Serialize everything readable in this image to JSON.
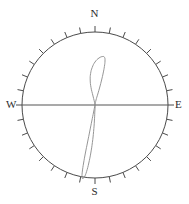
{
  "figure": {
    "title": "",
    "background_color": "#ffffff",
    "width": 189,
    "height": 204
  },
  "compass": {
    "north_label": "N",
    "south_label": "S",
    "west_label": "W",
    "east_label": "E",
    "center_x": 95,
    "center_y": 105,
    "radius": 73,
    "tick_count": 32,
    "tick_length": 6,
    "tick_step_degrees": 11.25,
    "axis_line": "west-east",
    "circle_color": "#4a4a4a",
    "tick_color": "#4a4a4a",
    "axis_color": "#555555",
    "curve_color": "#8a8a8a"
  },
  "chart_data": {
    "type": "line",
    "title": "",
    "subtitle": "",
    "xlabel": "",
    "ylabel": "",
    "projection": "polar-compass",
    "grid": false,
    "legend": null,
    "axis_ranges": {
      "theta_degrees": [
        0,
        360
      ],
      "r_normalized": [
        0,
        1
      ]
    },
    "tick_labels": [
      "N",
      "E",
      "S",
      "W"
    ],
    "tick_angles_degrees": [
      0,
      90,
      180,
      270
    ],
    "annotations": [],
    "series": [
      {
        "name": "orientation-trace",
        "closed": true,
        "description": "Narrow two-lobed (figure-eight) trace through the origin; short lobe points north-northeast, long lobe points south-southwest reaching the circle edge.",
        "points_xy": [
          [
            95,
            105
          ],
          [
            93.0,
            96.0
          ],
          [
            91.0,
            87.5
          ],
          [
            90.2,
            80.0
          ],
          [
            90.6,
            73.5
          ],
          [
            92.2,
            67.5
          ],
          [
            95.0,
            62.0
          ],
          [
            99.0,
            58.0
          ],
          [
            102.8,
            56.5
          ],
          [
            104.6,
            57.5
          ],
          [
            105.0,
            61.0
          ],
          [
            104.4,
            66.5
          ],
          [
            103.2,
            73.0
          ],
          [
            101.6,
            80.0
          ],
          [
            99.8,
            87.0
          ],
          [
            97.8,
            94.0
          ],
          [
            96.0,
            100.0
          ],
          [
            95.0,
            105.0
          ],
          [
            93.6,
            112.0
          ],
          [
            91.8,
            121.0
          ],
          [
            89.8,
            131.0
          ],
          [
            87.6,
            142.0
          ],
          [
            85.4,
            153.0
          ],
          [
            83.6,
            163.0
          ],
          [
            82.4,
            171.0
          ],
          [
            82.0,
            176.5
          ],
          [
            82.6,
            178.5
          ],
          [
            84.4,
            177.0
          ],
          [
            86.6,
            171.5
          ],
          [
            88.8,
            163.0
          ],
          [
            90.8,
            153.0
          ],
          [
            92.4,
            142.5
          ],
          [
            93.6,
            131.5
          ],
          [
            94.4,
            121.0
          ],
          [
            94.8,
            112.0
          ],
          [
            95.0,
            105.0
          ]
        ],
        "lobes": [
          {
            "name": "north-lobe",
            "tip_xy": [
              104.6,
              57.0
            ],
            "length_px": 48,
            "max_width_px": 14,
            "bearing_degrees": 11
          },
          {
            "name": "south-lobe",
            "tip_xy": [
              82.3,
              178.0
            ],
            "length_px": 74,
            "max_width_px": 11,
            "bearing_degrees": 190
          }
        ]
      }
    ]
  }
}
